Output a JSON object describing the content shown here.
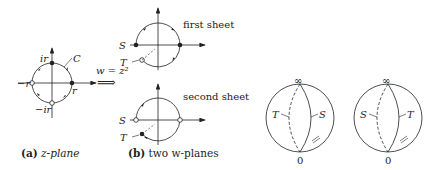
{
  "figure": {
    "panel_a": {
      "caption_bold": "(a)",
      "caption_rest": " z-plane",
      "labels": {
        "top": "ir",
        "right": "r",
        "left": "−r",
        "bottom": "−ir",
        "curve": "C"
      }
    },
    "mapping": {
      "label": "w = z²",
      "arrow": "⟹"
    },
    "panel_b": {
      "caption_bold": "(b)",
      "caption_rest": " two w-planes",
      "first_sheet": {
        "title": "first sheet",
        "label_s": "S",
        "label_t": "T"
      },
      "second_sheet": {
        "title": "second sheet",
        "label_s": "S",
        "label_t": "T"
      }
    },
    "spheres": [
      {
        "top": "∞",
        "bottom": "0",
        "left": "T",
        "right": "S",
        "mark": "="
      },
      {
        "top": "∞",
        "bottom": "0",
        "left": "S",
        "right": "T",
        "mark": "="
      }
    ]
  }
}
